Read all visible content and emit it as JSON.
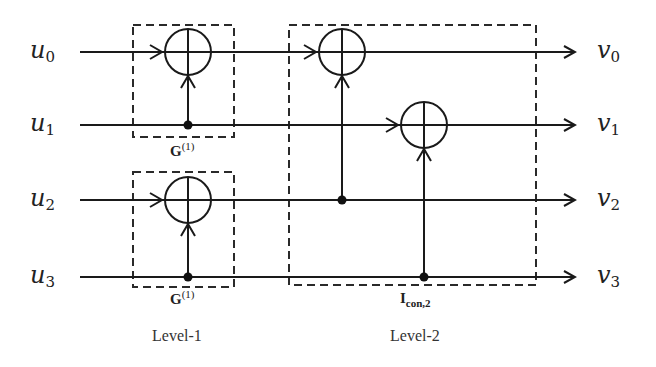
{
  "inputs": [
    {
      "base": "u",
      "sub": "0"
    },
    {
      "base": "u",
      "sub": "1"
    },
    {
      "base": "u",
      "sub": "2"
    },
    {
      "base": "u",
      "sub": "3"
    }
  ],
  "outputs": [
    {
      "base": "v",
      "sub": "0"
    },
    {
      "base": "v",
      "sub": "1"
    },
    {
      "base": "v",
      "sub": "2"
    },
    {
      "base": "v",
      "sub": "3"
    }
  ],
  "blocks": {
    "g_top": {
      "base": "G",
      "sup": "(1)"
    },
    "g_bottom": {
      "base": "G",
      "sup": "(1)"
    },
    "icon": {
      "base": "I",
      "sub": "con,2"
    }
  },
  "levels": {
    "level1": "Level-1",
    "level2": "Level-2"
  },
  "colors": {
    "stroke": "#1a1a1a",
    "dash": "#2a2a2a"
  }
}
